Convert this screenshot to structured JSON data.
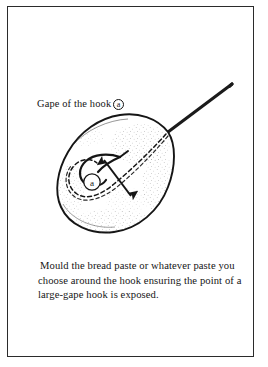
{
  "page": {
    "background_color": "#ffffff",
    "ink_color": "#1a1a1a",
    "frame_color": "#2b2b2b"
  },
  "illustration": {
    "title": "bread paste bait moulded around a fishing hook",
    "callout": {
      "prefix_text": "Gape of the hook",
      "marker_letter": "a"
    },
    "inline_marker": {
      "marker_letter": "a"
    },
    "parts": [
      {
        "name": "hook-shank",
        "style": "solid"
      },
      {
        "name": "hook-bend-and-point",
        "style": "solid"
      },
      {
        "name": "hook-hidden-outline",
        "style": "dashed"
      },
      {
        "name": "bait-outline",
        "style": "solid"
      },
      {
        "name": "bait-stipple-shading",
        "style": "stipple"
      },
      {
        "name": "gape-measure-arrow",
        "style": "double-headed-arrow"
      }
    ]
  },
  "caption": {
    "lines": [
      "Mould the bread paste or whatever paste you",
      "choose around the hook ensuring the point of a",
      "large-gape hook is exposed."
    ],
    "full_text": "Mould the bread paste or whatever paste you choose around the hook ensuring the point of a large-gape hook is exposed."
  }
}
